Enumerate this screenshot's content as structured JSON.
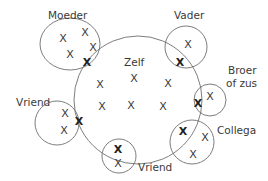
{
  "diagram": {
    "colors": {
      "stroke": "#6e6e6e",
      "text": "#3a3a3a",
      "background": "#ffffff"
    },
    "center_group": {
      "label": "Zelf",
      "shape": {
        "cx": 138,
        "cy": 100,
        "r": 64
      },
      "label_pos": {
        "x": 124,
        "y": 66
      },
      "marks": [
        {
          "x": 100,
          "y": 84
        },
        {
          "x": 134,
          "y": 78
        },
        {
          "x": 168,
          "y": 83
        },
        {
          "x": 102,
          "y": 106
        },
        {
          "x": 131,
          "y": 105
        },
        {
          "x": 163,
          "y": 106
        }
      ]
    },
    "groups": [
      {
        "id": "moeder",
        "label": "Moeder",
        "shape": {
          "type": "ellipse",
          "cx": 70,
          "cy": 44,
          "rx": 30,
          "ry": 26
        },
        "label_pos": {
          "x": 48,
          "y": 19
        },
        "marks": [
          {
            "x": 63,
            "y": 38,
            "bold": false
          },
          {
            "x": 85,
            "y": 32,
            "bold": false
          },
          {
            "x": 93,
            "y": 47,
            "bold": false
          },
          {
            "x": 70,
            "y": 54,
            "bold": false
          },
          {
            "x": 87,
            "y": 62,
            "bold": true
          }
        ]
      },
      {
        "id": "vader",
        "label": "Vader",
        "shape": {
          "type": "circle",
          "cx": 186,
          "cy": 47,
          "r": 21
        },
        "label_pos": {
          "x": 174,
          "y": 19
        },
        "marks": [
          {
            "x": 188,
            "y": 44,
            "bold": false
          },
          {
            "x": 180,
            "y": 62,
            "bold": true
          }
        ]
      },
      {
        "id": "broer-of-zus",
        "label": "Broer",
        "label2": "of zus",
        "shape": {
          "type": "circle",
          "cx": 210,
          "cy": 100,
          "r": 16
        },
        "label_pos": {
          "x": 228,
          "y": 74
        },
        "marks": [
          {
            "x": 210,
            "y": 96,
            "bold": false
          },
          {
            "x": 198,
            "y": 103,
            "bold": true
          }
        ]
      },
      {
        "id": "vriend-left",
        "label": "Vriend",
        "shape": {
          "type": "circle",
          "cx": 57,
          "cy": 123,
          "r": 22
        },
        "label_pos": {
          "x": 16,
          "y": 106
        },
        "marks": [
          {
            "x": 65,
            "y": 113,
            "bold": false
          },
          {
            "x": 64,
            "y": 130,
            "bold": false
          },
          {
            "x": 79,
            "y": 121,
            "bold": true
          }
        ]
      },
      {
        "id": "vriend-bottom",
        "label": "Vriend",
        "shape": {
          "type": "circle",
          "cx": 119,
          "cy": 156,
          "r": 17
        },
        "label_pos": {
          "x": 138,
          "y": 171
        },
        "marks": [
          {
            "x": 118,
            "y": 149,
            "bold": true
          },
          {
            "x": 118,
            "y": 163,
            "bold": false
          }
        ]
      },
      {
        "id": "collega",
        "label": "Collega",
        "shape": {
          "type": "circle",
          "cx": 192,
          "cy": 142,
          "r": 22
        },
        "label_pos": {
          "x": 217,
          "y": 134
        },
        "marks": [
          {
            "x": 183,
            "y": 131,
            "bold": true
          },
          {
            "x": 205,
            "y": 137,
            "bold": false
          },
          {
            "x": 193,
            "y": 154,
            "bold": false
          }
        ]
      }
    ],
    "mark_glyph": "X"
  }
}
